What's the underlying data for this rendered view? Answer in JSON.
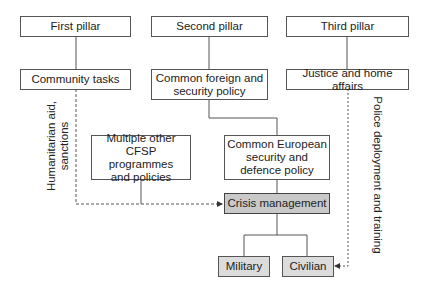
{
  "diagram": {
    "colors": {
      "box_border": "#555555",
      "box_fill": "#ffffff",
      "crisis_fill": "#c9c9c9",
      "outcome_fill": "#dcdcdc",
      "line": "#555555"
    },
    "nodes": {
      "first_pillar": "First pillar",
      "second_pillar": "Second pillar",
      "third_pillar": "Third pillar",
      "community_tasks": "Community tasks",
      "cfsp": "Common foreign and\nsecurity policy",
      "justice": "Justice and home affairs",
      "multiple_other": "Multiple other\nCFSP programmes\nand policies",
      "cesdp": "Common European\nsecurity and\ndefence policy",
      "crisis_management": "Crisis management",
      "military": "Military",
      "civilian": "Civilian"
    },
    "edge_labels": {
      "humanitarian": "Humanitarian aid,\nsanctions",
      "police": "Police deployment and training"
    },
    "edges": [
      {
        "from": "First pillar",
        "to": "Community tasks",
        "style": "solid"
      },
      {
        "from": "Second pillar",
        "to": "Common foreign and security policy",
        "style": "solid"
      },
      {
        "from": "Third pillar",
        "to": "Justice and home affairs",
        "style": "solid"
      },
      {
        "from": "Common foreign and security policy",
        "to": "Common European security and defence policy",
        "style": "solid"
      },
      {
        "from": "Common European security and defence policy",
        "to": "Crisis management",
        "style": "solid"
      },
      {
        "from": "Multiple other CFSP programmes and policies",
        "to": "Crisis management",
        "style": "solid-joins-dashed"
      },
      {
        "from": "Community tasks",
        "to": "Crisis management",
        "style": "dashed-arrow",
        "label": "Humanitarian aid, sanctions"
      },
      {
        "from": "Crisis management",
        "to": "Military",
        "style": "solid"
      },
      {
        "from": "Crisis management",
        "to": "Civilian",
        "style": "solid"
      },
      {
        "from": "Justice and home affairs",
        "to": "Civilian",
        "style": "dashed-arrow",
        "label": "Police deployment and training"
      }
    ]
  }
}
